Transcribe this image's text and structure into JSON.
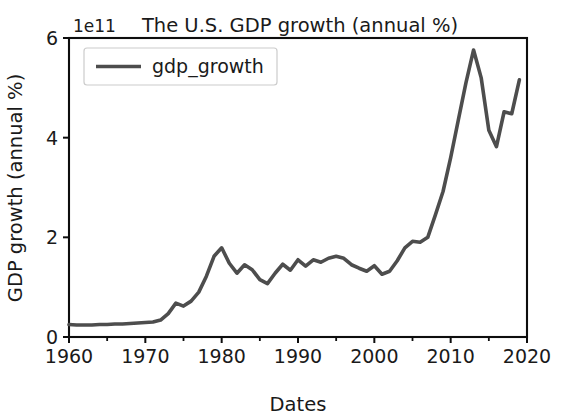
{
  "chart_data": {
    "type": "line",
    "title": "The U.S. GDP growth (annual %)",
    "xlabel": "Dates",
    "ylabel": "GDP growth (annual %)",
    "y_offset_text": "1e11",
    "xlim": [
      1960,
      2020
    ],
    "ylim": [
      0,
      6
    ],
    "grid": false,
    "legend_position": "upper left",
    "line_color": "#4d4d4d",
    "axis_color": "#0d0d0d",
    "xticks": [
      1960,
      1970,
      1980,
      1990,
      2000,
      2010,
      2020
    ],
    "xtick_labels": [
      "1960",
      "1970",
      "1980",
      "1990",
      "2000",
      "2010",
      "2020"
    ],
    "xticks_minor": [
      1965,
      1975,
      1985,
      1995,
      2005,
      2015
    ],
    "yticks": [
      0,
      2,
      4,
      6
    ],
    "ytick_labels": [
      "0",
      "2",
      "4",
      "6"
    ],
    "series": [
      {
        "name": "gdp_growth",
        "x": [
          1960,
          1961,
          1962,
          1963,
          1964,
          1965,
          1966,
          1967,
          1968,
          1969,
          1970,
          1971,
          1972,
          1973,
          1974,
          1975,
          1976,
          1977,
          1978,
          1979,
          1980,
          1981,
          1982,
          1983,
          1984,
          1985,
          1986,
          1987,
          1988,
          1989,
          1990,
          1991,
          1992,
          1993,
          1994,
          1995,
          1996,
          1997,
          1998,
          1999,
          2000,
          2001,
          2002,
          2003,
          2004,
          2005,
          2006,
          2007,
          2008,
          2009,
          2010,
          2011,
          2012,
          2013,
          2014,
          2015,
          2016,
          2017,
          2018,
          2019
        ],
        "values": [
          0.25,
          0.24,
          0.24,
          0.24,
          0.25,
          0.25,
          0.26,
          0.26,
          0.27,
          0.28,
          0.29,
          0.3,
          0.34,
          0.47,
          0.68,
          0.62,
          0.72,
          0.9,
          1.22,
          1.62,
          1.79,
          1.48,
          1.28,
          1.45,
          1.35,
          1.15,
          1.07,
          1.28,
          1.46,
          1.34,
          1.55,
          1.42,
          1.55,
          1.5,
          1.58,
          1.62,
          1.58,
          1.45,
          1.38,
          1.32,
          1.43,
          1.26,
          1.32,
          1.53,
          1.79,
          1.92,
          1.9,
          2.0,
          2.45,
          2.92,
          3.6,
          4.35,
          5.1,
          5.76,
          5.2,
          4.15,
          3.82,
          4.52,
          4.48,
          5.16
        ]
      }
    ]
  }
}
